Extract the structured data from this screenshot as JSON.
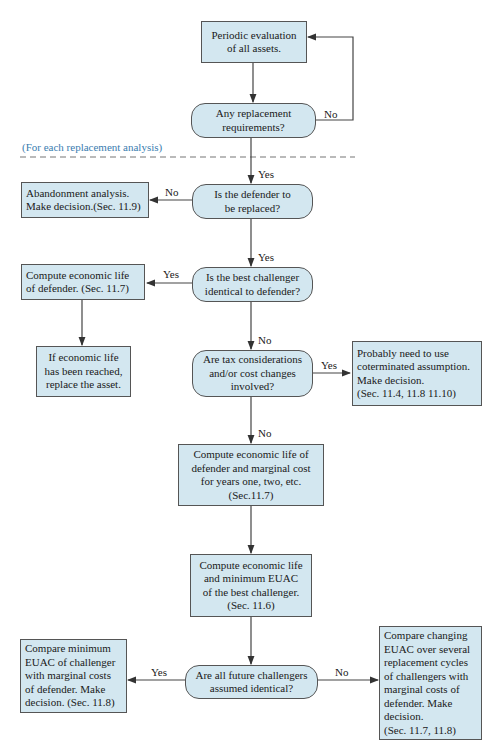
{
  "section_note": "(For each replacement analysis)",
  "nodes": {
    "periodic_eval": "Periodic evaluation\nof all assets.",
    "any_replacement": "Any replacement\nrequirements?",
    "defender_replaced": "Is the defender to\nbe replaced?",
    "abandonment": "Abandonment analysis.\nMake decision.(Sec. 11.9)",
    "challenger_identical": "Is the best challenger\nidentical to defender?",
    "compute_econ_life_def": "Compute economic life\nof defender. (Sec. 11.7)",
    "if_econ_life_reached": "If economic life\nhas been reached,\nreplace the asset.",
    "tax_cost_changes": "Are tax considerations\nand/or cost changes\ninvolved?",
    "coterminated": "Probably need to  use\ncoterminated assumption.\nMake decision.\n(Sec. 11.4, 11.8 11.10)",
    "compute_marginal_cost": "Compute economic life of\ndefender and marginal  cost\nfor years one, two, etc.\n(Sec.11.7)",
    "compute_min_euac": "Compute economic life\nand minimum EUAC\nof the best challenger.\n(Sec. 11.6)",
    "future_identical": "Are all future challengers\nassumed identical?",
    "compare_min_euac": "Compare minimum\nEUAC of challenger\nwith marginal costs\nof defender. Make\ndecision. (Sec. 11.8)",
    "compare_changing_euac": "Compare changing\nEUAC over several\nreplacement cycles\nof challengers with\nmarginal costs of\ndefender. Make\ndecision.\n(Sec. 11.7, 11.8)"
  },
  "edge_labels": {
    "loop_no": "No",
    "to_defender_yes": "Yes",
    "abandon_no": "No",
    "to_challenger_yes": "Yes",
    "econ_life_yes": "Yes",
    "to_tax_no": "No",
    "coterminated_yes": "Yes",
    "to_marginal_no": "No",
    "future_yes": "Yes",
    "future_no": "No"
  },
  "colors": {
    "box_fill": "#d3e7f0",
    "border": "#555555",
    "note": "#3a7db0"
  }
}
